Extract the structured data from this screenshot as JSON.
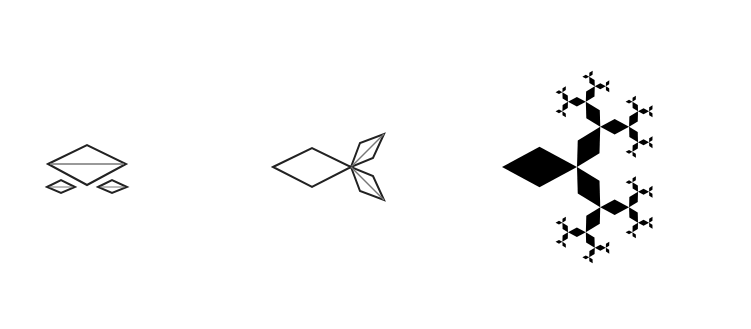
{
  "figures": [
    {
      "id": "stage-1",
      "description": "Outline rhombus with two small rhombi below",
      "style": "outline"
    },
    {
      "id": "stage-2",
      "description": "Outline rhombus with two branching rhombi at tip",
      "style": "outline"
    },
    {
      "id": "stage-3",
      "description": "Filled recursive rhombus fractal tree",
      "style": "filled"
    }
  ],
  "colors": {
    "stroke": "#222222",
    "fill": "#000000",
    "inner_line": "#777777",
    "background": "#ffffff"
  },
  "fractal": {
    "depth": 5,
    "branch_angle_deg": 60,
    "scale": 0.62
  }
}
